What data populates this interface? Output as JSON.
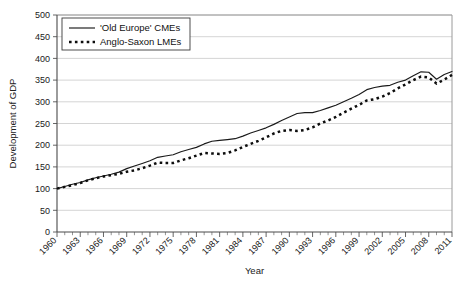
{
  "chart_data": {
    "type": "line",
    "title": "",
    "xlabel": "Year",
    "ylabel": "Development of GDP",
    "xlim": [
      1960,
      2011
    ],
    "ylim": [
      0,
      500
    ],
    "ytick_step": 50,
    "yticks": [
      0,
      50,
      100,
      150,
      200,
      250,
      300,
      350,
      400,
      450,
      500
    ],
    "xticks": [
      1960,
      1963,
      1966,
      1969,
      1972,
      1975,
      1978,
      1981,
      1984,
      1987,
      1990,
      1993,
      1996,
      1999,
      2002,
      2005,
      2008,
      2011
    ],
    "x_minor_step": 1,
    "grid": "horizontal",
    "legend_position": "top-left",
    "x": [
      1960,
      1961,
      1962,
      1963,
      1964,
      1965,
      1966,
      1967,
      1968,
      1969,
      1970,
      1971,
      1972,
      1973,
      1974,
      1975,
      1976,
      1977,
      1978,
      1979,
      1980,
      1981,
      1982,
      1983,
      1984,
      1985,
      1986,
      1987,
      1988,
      1989,
      1990,
      1991,
      1992,
      1993,
      1994,
      1995,
      1996,
      1997,
      1998,
      1999,
      2000,
      2001,
      2002,
      2003,
      2004,
      2005,
      2006,
      2007,
      2008,
      2009,
      2010,
      2011
    ],
    "series": [
      {
        "name": "'Old Europe' CMEs",
        "style": "solid",
        "color": "#1a1a1a",
        "values": [
          100,
          105,
          110,
          114,
          120,
          125,
          129,
          133,
          138,
          146,
          152,
          158,
          164,
          172,
          175,
          178,
          185,
          190,
          195,
          203,
          209,
          211,
          213,
          215,
          221,
          228,
          234,
          240,
          248,
          257,
          265,
          273,
          275,
          275,
          280,
          286,
          292,
          300,
          308,
          317,
          328,
          333,
          336,
          338,
          345,
          350,
          360,
          369,
          368,
          352,
          363,
          370
        ]
      },
      {
        "name": "Anglo-Saxon LMEs",
        "style": "dotted",
        "color": "#0d0d0d",
        "values": [
          100,
          104,
          108,
          113,
          119,
          124,
          128,
          131,
          134,
          139,
          142,
          147,
          153,
          160,
          159,
          159,
          165,
          170,
          176,
          182,
          181,
          180,
          182,
          188,
          196,
          203,
          210,
          218,
          227,
          233,
          235,
          233,
          235,
          241,
          250,
          257,
          265,
          275,
          284,
          293,
          303,
          306,
          312,
          320,
          331,
          340,
          350,
          358,
          356,
          342,
          351,
          362
        ]
      }
    ]
  },
  "legend": {
    "items": [
      {
        "label": "'Old Europe' CMEs",
        "style": "solid"
      },
      {
        "label": "Anglo-Saxon LMEs",
        "style": "dotted"
      }
    ]
  },
  "axes": {
    "x_title": "Year",
    "y_title": "Development of GDP"
  }
}
